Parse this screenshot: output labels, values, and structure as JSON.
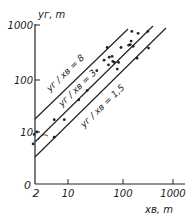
{
  "chart_data": {
    "type": "scatter",
    "title": "",
    "xlabel": "x_B, m",
    "ylabel": "y_r, m",
    "xscale": "log",
    "yscale": "log",
    "xlim": [
      2,
      1000
    ],
    "ylim": [
      1,
      1000
    ],
    "x_ticks": [
      "2",
      "10",
      "100",
      "1000"
    ],
    "y_ticks": [
      "0",
      "10",
      "100",
      "1000"
    ],
    "grid": false,
    "reference_lines": [
      {
        "label": "y_r / x_B = 8",
        "ratio": 8
      },
      {
        "label": "y_r / x_B = 3",
        "ratio": 3
      },
      {
        "label": "y_r / x_B = 1.5",
        "ratio": 1.5
      }
    ],
    "points": [
      {
        "x": 2.2,
        "y": 6
      },
      {
        "x": 2.3,
        "y": 9
      },
      {
        "x": 2.6,
        "y": 10
      },
      {
        "x": 5.5,
        "y": 8
      },
      {
        "x": 5.5,
        "y": 17
      },
      {
        "x": 8.5,
        "y": 17
      },
      {
        "x": 16,
        "y": 40
      },
      {
        "x": 23,
        "y": 60
      },
      {
        "x": 35,
        "y": 140
      },
      {
        "x": 48,
        "y": 220
      },
      {
        "x": 55,
        "y": 380
      },
      {
        "x": 58,
        "y": 180
      },
      {
        "x": 60,
        "y": 250
      },
      {
        "x": 68,
        "y": 260
      },
      {
        "x": 70,
        "y": 210
      },
      {
        "x": 75,
        "y": 200
      },
      {
        "x": 85,
        "y": 150
      },
      {
        "x": 90,
        "y": 200
      },
      {
        "x": 100,
        "y": 380
      },
      {
        "x": 140,
        "y": 420
      },
      {
        "x": 150,
        "y": 430
      },
      {
        "x": 155,
        "y": 500
      },
      {
        "x": 160,
        "y": 760
      },
      {
        "x": 170,
        "y": 400
      },
      {
        "x": 200,
        "y": 240
      },
      {
        "x": 210,
        "y": 700
      },
      {
        "x": 320,
        "y": 760
      },
      {
        "x": 330,
        "y": 370
      }
    ]
  },
  "labels": {
    "y_axis_title": "yг, m",
    "x_axis_title": "xв, m",
    "line_8": "yг / xв = 8",
    "line_3": "yг / xв = 3",
    "line_15": "yг / xв = 1,5",
    "tick_y_1000": "1000",
    "tick_y_100": "100",
    "tick_y_10": "10",
    "tick_y_0": "0",
    "tick_x_2": "2",
    "tick_x_10": "10",
    "tick_x_100": "100",
    "tick_x_1000": "1000"
  }
}
